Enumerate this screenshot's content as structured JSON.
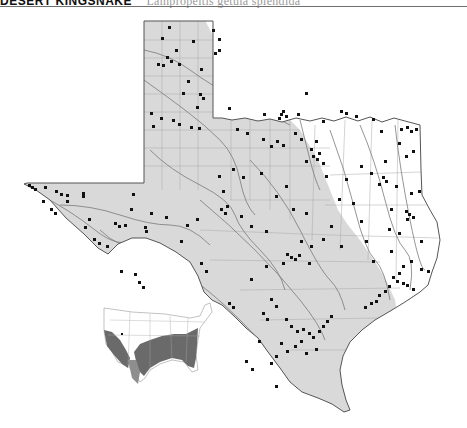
{
  "header": {
    "title": "DESERT KINGSNAKE",
    "scientific_name": "Lampropeltis getula splendida"
  },
  "map": {
    "region": "Texas",
    "colors": {
      "range_fill": "#d9d9d9",
      "outside_fill": "#ffffff",
      "border": "#555555",
      "rivers": "#7a7a7a",
      "county_lines": "#a8a8a8",
      "records": "#111111"
    },
    "legend_semantics": {
      "shaded_area": "subspecies range",
      "dots": "locality records"
    }
  },
  "inset": {
    "region": "United States",
    "colors": {
      "range_fill": "#6a6a6a",
      "subrange_fill": "#8e8e8e",
      "land": "#ffffff",
      "lines": "#999999"
    }
  }
}
